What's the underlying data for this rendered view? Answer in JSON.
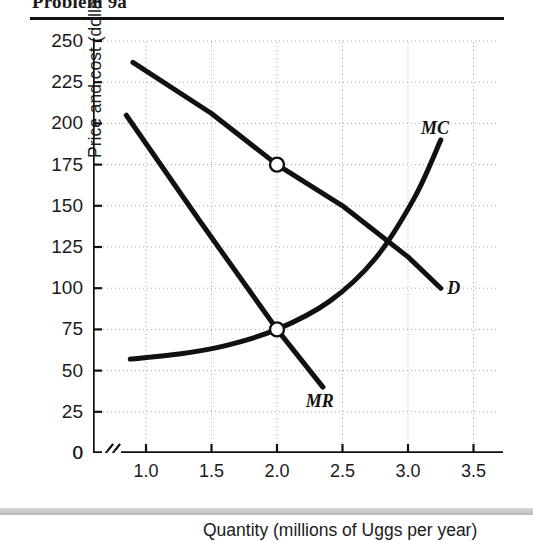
{
  "heading": {
    "text": "Problem 9a"
  },
  "chart_data": {
    "type": "line",
    "title": "",
    "xlabel": "Quantity (millions of Uggs per year)",
    "ylabel": "Price and cost (dollars per Ugg)",
    "xlim": [
      0.75,
      3.65
    ],
    "ylim": [
      0,
      250
    ],
    "axis_break_x": true,
    "grid": true,
    "legend_position": "inline-curve-labels",
    "x_ticks": [
      "1.0",
      "1.5",
      "2.0",
      "2.5",
      "3.0",
      "3.5"
    ],
    "x_tick_values": [
      1.0,
      1.5,
      2.0,
      2.5,
      3.0,
      3.5
    ],
    "y_ticks": [
      "0",
      "25",
      "50",
      "75",
      "100",
      "125",
      "150",
      "175",
      "200",
      "225",
      "250"
    ],
    "y_tick_values": [
      0,
      25,
      50,
      75,
      100,
      125,
      150,
      175,
      200,
      225,
      250
    ],
    "series": [
      {
        "name": "D",
        "label": "D",
        "kind": "demand",
        "x": [
          0.9,
          1.5,
          2.0,
          2.5,
          3.0,
          3.25
        ],
        "values": [
          237,
          206,
          175,
          150,
          119,
          100
        ]
      },
      {
        "name": "MR",
        "label": "MR",
        "kind": "marginal-revenue",
        "x": [
          0.85,
          1.4,
          2.0,
          2.35
        ],
        "values": [
          205,
          142,
          75,
          40
        ]
      },
      {
        "name": "MC",
        "label": "MC",
        "kind": "marginal-cost",
        "x": [
          0.88,
          1.25,
          1.6,
          2.0,
          2.4,
          2.75,
          3.05,
          3.25
        ],
        "values": [
          57,
          60,
          65,
          75,
          92,
          118,
          155,
          190
        ]
      }
    ],
    "annotations": [
      {
        "name": "monopoly-price-point",
        "marker": "open-circle",
        "x": 2.0,
        "y": 175,
        "on": "D"
      },
      {
        "name": "mr-mc-intersection-point",
        "marker": "open-circle",
        "x": 2.0,
        "y": 75,
        "on": "MR/MC"
      }
    ]
  }
}
